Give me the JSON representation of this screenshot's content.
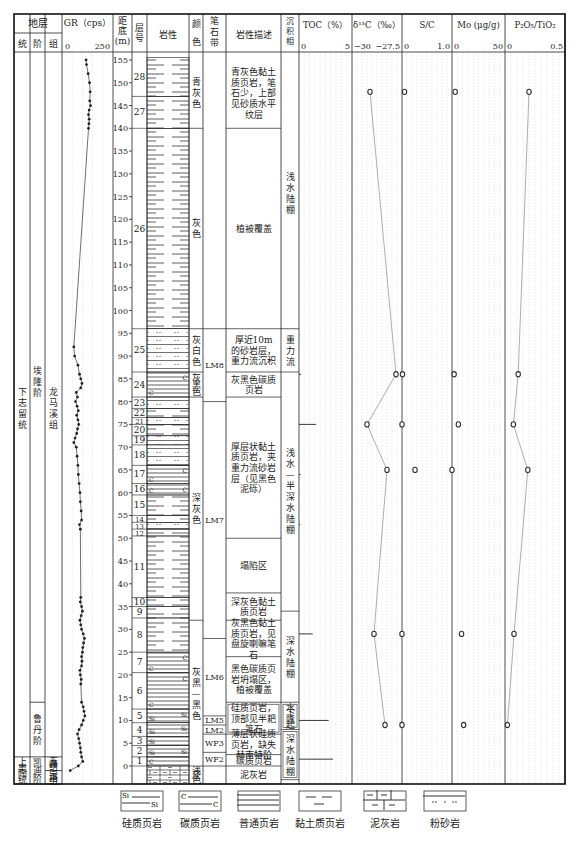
{
  "header": {
    "strata": "地层",
    "series": "统",
    "stage": "阶",
    "formation": "组",
    "gr": "GR（cps）",
    "gr_min": "0",
    "gr_max": "250",
    "depth": [
      "距",
      "底",
      "(m)"
    ],
    "layer_no": [
      "层",
      "号"
    ],
    "lithology": "岩性",
    "color": [
      "颜",
      "色"
    ],
    "graptolite": [
      "笔",
      "石",
      "带"
    ],
    "description": "岩性描述",
    "facies": [
      "沉",
      "积",
      "相"
    ],
    "toc": "TOC（%）",
    "toc_min": "0",
    "toc_max": "5",
    "d13c": "δ¹³C（‰）",
    "d13c_min": "−30",
    "d13c_max": "−27.5",
    "sc": "S/C",
    "sc_min": "0",
    "sc_max": "1.0",
    "mo": "Mo (μg/g)",
    "mo_min": "0",
    "mo_max": "50",
    "pti": "P₂O₅/TiO₂",
    "pti_min": "0",
    "pti_max": "0.5"
  },
  "strata": {
    "series": [
      {
        "label": "下志留统",
        "top": 155,
        "bottom": 2
      },
      {
        "label": "上奥陶统",
        "top": 2,
        "bottom": -4
      }
    ],
    "stages": [
      {
        "label": "埃隆阶",
        "top": 155,
        "bottom": 14
      },
      {
        "label": "鲁丹阶",
        "top": 14,
        "bottom": 2
      },
      {
        "label": "凯迪阶",
        "top": 2,
        "bottom": -4
      }
    ],
    "formations": [
      {
        "label": "龙马溪组",
        "top": 155,
        "bottom": 2
      },
      {
        "label": "五峰组",
        "top": 2,
        "bottom": -1
      },
      {
        "label": "宝塔组",
        "top": -1,
        "bottom": -4
      }
    ]
  },
  "depth_ticks": [
    155,
    150,
    145,
    140,
    135,
    130,
    125,
    120,
    115,
    110,
    105,
    100,
    95,
    90,
    85,
    80,
    75,
    70,
    65,
    60,
    55,
    50,
    45,
    40,
    35,
    30,
    25,
    20,
    15,
    10,
    5,
    0
  ],
  "layers": [
    {
      "no": "28",
      "top": 155.5,
      "bottom": 147,
      "lith": "clay"
    },
    {
      "no": "27",
      "top": 147,
      "bottom": 140,
      "lith": "clay"
    },
    {
      "no": "26",
      "top": 140,
      "bottom": 96,
      "lith": "clay"
    },
    {
      "no": "25",
      "top": 96,
      "bottom": 86.5,
      "lith": "silt"
    },
    {
      "no": "24",
      "top": 86.5,
      "bottom": 81,
      "lith": "carb"
    },
    {
      "no": "23",
      "top": 81,
      "bottom": 78.5,
      "lith": "silt"
    },
    {
      "no": "22",
      "top": 78.5,
      "bottom": 76.5,
      "lith": "clay"
    },
    {
      "no": "21",
      "top": 76.5,
      "bottom": 75,
      "lith": "silt"
    },
    {
      "no": "20",
      "top": 75,
      "bottom": 72.5,
      "lith": "clay"
    },
    {
      "no": "19",
      "top": 72.5,
      "bottom": 70.5,
      "lith": "silt"
    },
    {
      "no": "18",
      "top": 70.5,
      "bottom": 66,
      "lith": "silt"
    },
    {
      "no": "17",
      "top": 66,
      "bottom": 62,
      "lith": "carb"
    },
    {
      "no": "16",
      "top": 62,
      "bottom": 59.5,
      "lith": "carb"
    },
    {
      "no": "15",
      "top": 59.5,
      "bottom": 55,
      "lith": "clay"
    },
    {
      "no": "14",
      "top": 55,
      "bottom": 53.5,
      "lith": "clay"
    },
    {
      "no": "13",
      "top": 53.5,
      "bottom": 52,
      "lith": "silt"
    },
    {
      "no": "12",
      "top": 52,
      "bottom": 50.5,
      "lith": "clay"
    },
    {
      "no": "11",
      "top": 50.5,
      "bottom": 37,
      "lith": "clay"
    },
    {
      "no": "10",
      "top": 37,
      "bottom": 35,
      "lith": "clay"
    },
    {
      "no": "9",
      "top": 35,
      "bottom": 32.5,
      "lith": "clay"
    },
    {
      "no": "8",
      "top": 32.5,
      "bottom": 25,
      "lith": "clay"
    },
    {
      "no": "7",
      "top": 25,
      "bottom": 20.5,
      "lith": "carb"
    },
    {
      "no": "6",
      "top": 20.5,
      "bottom": 12.5,
      "lith": "carb"
    },
    {
      "no": "5",
      "top": 12.5,
      "bottom": 9.5,
      "lith": "si"
    },
    {
      "no": "4",
      "top": 9.5,
      "bottom": 6.5,
      "lith": "si"
    },
    {
      "no": "3",
      "top": 6.5,
      "bottom": 4.5,
      "lith": "si"
    },
    {
      "no": "2",
      "top": 4.5,
      "bottom": 2,
      "lith": "si"
    },
    {
      "no": "1",
      "top": 2,
      "bottom": 0,
      "lith": "carb"
    },
    {
      "no": "",
      "top": 0,
      "bottom": -4,
      "lith": "marl"
    }
  ],
  "colors": [
    {
      "label": "青灰色",
      "top": 155.5,
      "bottom": 140
    },
    {
      "label": "灰色",
      "top": 140,
      "bottom": 96
    },
    {
      "label": "灰白色",
      "top": 96,
      "bottom": 86.5
    },
    {
      "label": "灰黑色",
      "top": 86.5,
      "bottom": 81
    },
    {
      "label": "深灰色",
      "top": 81,
      "bottom": 32
    },
    {
      "label": "灰黑—黑色",
      "top": 32,
      "bottom": 0
    },
    {
      "label": "浅灰色",
      "top": 0,
      "bottom": -4
    }
  ],
  "graptolite_zones": [
    {
      "label": "",
      "top": 155.5,
      "bottom": 96
    },
    {
      "label": "LM8",
      "top": 96,
      "bottom": 80
    },
    {
      "label": "LM7",
      "top": 80,
      "bottom": 28
    },
    {
      "label": "LM6",
      "top": 28,
      "bottom": 11
    },
    {
      "label": "LM5",
      "top": 11,
      "bottom": 9
    },
    {
      "label": "LM2",
      "top": 9,
      "bottom": 7
    },
    {
      "label": "WF3",
      "top": 7,
      "bottom": 3
    },
    {
      "label": "WF2",
      "top": 3,
      "bottom": 0
    },
    {
      "label": "",
      "top": 0,
      "bottom": -4
    }
  ],
  "descriptions": [
    {
      "label": "青灰色黏土质页岩，笔石少，上部见砂质水平纹层",
      "top": 155.5,
      "bottom": 140
    },
    {
      "label": "植被覆盖",
      "top": 140,
      "bottom": 96
    },
    {
      "label": "厚近10m的砂岩层，重力流沉积",
      "top": 96,
      "bottom": 86.5
    },
    {
      "label": "灰黑色碳质页岩",
      "top": 86.5,
      "bottom": 81
    },
    {
      "label": "厚层状黏土质页岩，夹重力流砂岩层（见黑色泥砾）",
      "top": 81,
      "bottom": 50
    },
    {
      "label": "塌陷区",
      "top": 50,
      "bottom": 38
    },
    {
      "label": "深灰色黏土质页岩",
      "top": 38,
      "bottom": 32
    },
    {
      "label": "灰黑色黏土质页岩，见盘旋喇嘛笔石",
      "top": 32,
      "bottom": 24
    },
    {
      "label": "黑色碳质页岩坍塌区，植被覆盖",
      "top": 24,
      "bottom": 14
    },
    {
      "label": "硅质页岩，顶部见半耙笔石",
      "top": 14,
      "bottom": 7,
      "bracket": true
    },
    {
      "label": "薄层状硅质页岩，缺失赫南特阶",
      "top": 7,
      "bottom": 2.5
    },
    {
      "label": "碳质页岩",
      "top": 2.5,
      "bottom": 0
    },
    {
      "label": "泥灰岩",
      "top": 0,
      "bottom": -4
    }
  ],
  "facies": [
    {
      "label": "浅水陆棚",
      "top": 155.5,
      "bottom": 96
    },
    {
      "label": "重力流",
      "top": 96,
      "bottom": 86.5
    },
    {
      "label": "浅水—半深水陆棚",
      "top": 86.5,
      "bottom": 34
    },
    {
      "label": "深水陆棚",
      "top": 34,
      "bottom": 14
    },
    {
      "label": "水下隆起",
      "top": 14,
      "bottom": 8,
      "bracket": true
    },
    {
      "label": "深水陆棚",
      "top": 8,
      "bottom": -3,
      "bracket": true
    }
  ],
  "legend": [
    {
      "key": "si",
      "label": "硅质页岩"
    },
    {
      "key": "carb",
      "label": "碳质页岩"
    },
    {
      "key": "shale",
      "label": "普通页岩"
    },
    {
      "key": "clay",
      "label": "黏土质页岩"
    },
    {
      "key": "marl",
      "label": "泥灰岩"
    },
    {
      "key": "silt",
      "label": "粉砂岩"
    }
  ],
  "chart_data": {
    "type": "line",
    "title": "",
    "ylabel": "距底 (m)",
    "ylim": [
      0,
      155
    ],
    "grid": true,
    "series": [
      {
        "name": "GR (cps)",
        "xlim": [
          0,
          250
        ],
        "type": "line-dots",
        "points": [
          [
            155,
            118
          ],
          [
            154,
            120
          ],
          [
            152,
            128
          ],
          [
            150,
            135
          ],
          [
            148,
            138
          ],
          [
            146,
            136
          ],
          [
            145,
            140
          ],
          [
            144,
            133
          ],
          [
            143,
            130
          ],
          [
            142,
            133
          ],
          [
            141,
            132
          ],
          [
            140,
            130
          ],
          [
            92,
            58
          ],
          [
            90,
            62
          ],
          [
            88,
            78
          ],
          [
            86,
            86
          ],
          [
            85,
            92
          ],
          [
            84,
            98
          ],
          [
            83,
            92
          ],
          [
            82,
            70
          ],
          [
            81,
            76
          ],
          [
            80,
            66
          ],
          [
            79,
            74
          ],
          [
            78,
            80
          ],
          [
            77,
            72
          ],
          [
            76,
            78
          ],
          [
            75,
            82
          ],
          [
            74,
            76
          ],
          [
            73,
            72
          ],
          [
            72,
            64
          ],
          [
            71,
            58
          ],
          [
            70,
            70
          ],
          [
            68,
            74
          ],
          [
            66,
            78
          ],
          [
            64,
            80
          ],
          [
            62,
            84
          ],
          [
            60,
            88
          ],
          [
            58,
            90
          ],
          [
            56,
            94
          ],
          [
            54,
            96
          ],
          [
            53,
            86
          ],
          [
            52,
            90
          ],
          [
            37,
            92
          ],
          [
            36,
            90
          ],
          [
            35,
            96
          ],
          [
            34,
            100
          ],
          [
            33,
            94
          ],
          [
            32,
            88
          ],
          [
            31,
            92
          ],
          [
            30,
            96
          ],
          [
            29,
            104
          ],
          [
            28,
            110
          ],
          [
            27,
            106
          ],
          [
            26,
            102
          ],
          [
            25,
            100
          ],
          [
            24,
            96
          ],
          [
            23,
            98
          ],
          [
            22,
            96
          ],
          [
            21,
            88
          ],
          [
            20,
            90
          ],
          [
            19,
            94
          ],
          [
            18,
            92
          ],
          [
            14,
            96
          ],
          [
            13,
            104
          ],
          [
            12,
            108
          ],
          [
            11,
            112
          ],
          [
            10,
            104
          ],
          [
            9,
            96
          ],
          [
            8,
            84
          ],
          [
            7,
            76
          ],
          [
            6,
            82
          ],
          [
            5,
            86
          ],
          [
            4,
            90
          ],
          [
            3,
            92
          ],
          [
            2,
            96
          ],
          [
            1,
            102
          ],
          [
            0,
            80
          ],
          [
            -1,
            40
          ]
        ]
      },
      {
        "name": "TOC (%)",
        "xlim": [
          0,
          5
        ],
        "type": "bar",
        "points": [
          [
            86,
            0.2
          ],
          [
            75,
            1.6
          ],
          [
            64,
            0.15
          ],
          [
            53,
            0.1
          ],
          [
            29,
            1.3
          ],
          [
            10,
            2.8
          ],
          [
            1.5,
            3.2
          ]
        ]
      },
      {
        "name": "δ13C (‰)",
        "xlim": [
          -30,
          -27.5
        ],
        "points": [
          [
            148,
            -29.1
          ],
          [
            86,
            -27.8
          ],
          [
            75,
            -29.25
          ],
          [
            65,
            -28.25
          ],
          [
            29,
            -28.9
          ],
          [
            9,
            -28.35
          ]
        ]
      },
      {
        "name": "S/C",
        "xlim": [
          0,
          1.0
        ],
        "points": [
          [
            148,
            0.05
          ],
          [
            86,
            0.01
          ],
          [
            75,
            0.0
          ],
          [
            65,
            0.26
          ],
          [
            29,
            0.0
          ],
          [
            9,
            0.0
          ]
        ]
      },
      {
        "name": "Mo (μg/g)",
        "xlim": [
          0,
          50
        ],
        "points": [
          [
            148,
            3
          ],
          [
            86,
            2
          ],
          [
            75,
            6
          ],
          [
            65,
            0
          ],
          [
            29,
            9
          ],
          [
            9,
            11
          ]
        ]
      },
      {
        "name": "P2O5/TiO2",
        "xlim": [
          0,
          0.5
        ],
        "points": [
          [
            148,
            0.2
          ],
          [
            86,
            0.11
          ],
          [
            75,
            0.07
          ],
          [
            65,
            0.19
          ],
          [
            29,
            0.075
          ],
          [
            9,
            0.02
          ]
        ]
      }
    ]
  }
}
